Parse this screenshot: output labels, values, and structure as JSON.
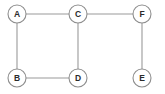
{
  "diagram": {
    "type": "node-link-graph",
    "width": 165,
    "height": 94,
    "background_color": "#ffffff",
    "node_style": {
      "radius": 9,
      "fill": "#ffffff",
      "stroke": "#8e8e8e",
      "stroke_width": 1.1,
      "label_color": "#2b2b2b"
    },
    "edge_style": {
      "stroke": "#9a9a9a",
      "stroke_width": 1.1
    },
    "nodes": [
      {
        "id": "A",
        "label": "A",
        "cx": 17,
        "cy": 14
      },
      {
        "id": "C",
        "label": "C",
        "cx": 78,
        "cy": 14
      },
      {
        "id": "F",
        "label": "F",
        "cx": 142,
        "cy": 14
      },
      {
        "id": "B",
        "label": "B",
        "cx": 17,
        "cy": 78
      },
      {
        "id": "D",
        "label": "D",
        "cx": 78,
        "cy": 78
      },
      {
        "id": "E",
        "label": "E",
        "cx": 142,
        "cy": 78
      }
    ],
    "edges": [
      {
        "id": "A-C",
        "from": "A",
        "to": "C",
        "x1": 26,
        "y1": 14,
        "x2": 69,
        "y2": 14
      },
      {
        "id": "C-F",
        "from": "C",
        "to": "F",
        "x1": 87,
        "y1": 14,
        "x2": 133,
        "y2": 14
      },
      {
        "id": "A-B",
        "from": "A",
        "to": "B",
        "x1": 17,
        "y1": 23,
        "x2": 17,
        "y2": 69
      },
      {
        "id": "C-D",
        "from": "C",
        "to": "D",
        "x1": 78,
        "y1": 23,
        "x2": 78,
        "y2": 69
      },
      {
        "id": "B-D",
        "from": "B",
        "to": "D",
        "x1": 26,
        "y1": 78,
        "x2": 69,
        "y2": 78
      },
      {
        "id": "F-E",
        "from": "F",
        "to": "E",
        "x1": 142,
        "y1": 23,
        "x2": 142,
        "y2": 69
      }
    ]
  }
}
